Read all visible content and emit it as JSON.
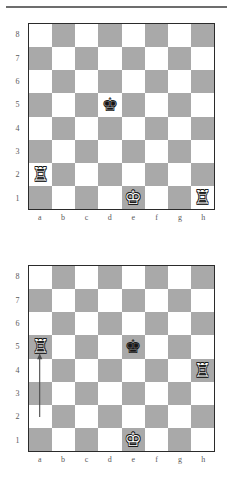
{
  "document": {
    "type": "chess-diagram-pair",
    "top_rule": true
  },
  "labels": {
    "ranks": [
      "8",
      "7",
      "6",
      "5",
      "4",
      "3",
      "2",
      "1"
    ],
    "files": [
      "a",
      "b",
      "c",
      "d",
      "e",
      "f",
      "g",
      "h"
    ]
  },
  "glyphs": {
    "white_king": "♔",
    "white_rook": "♖",
    "black_king": "♚"
  },
  "colors": {
    "light_square": "#ffffff",
    "dark_square": "#a9a9a9",
    "border": "#2b2b2b",
    "label": "#5a5a5a",
    "arrow": "#4a4a4a",
    "rule": "#6d6d6d"
  },
  "diagrams": [
    {
      "id": "diagram-1",
      "name": "position-before-move",
      "pieces": [
        {
          "square": "d5",
          "file": 3,
          "rank": 5,
          "piece": "black_king",
          "color": "black",
          "name": "black-king-d5"
        },
        {
          "square": "a2",
          "file": 0,
          "rank": 2,
          "piece": "white_rook",
          "color": "white",
          "name": "white-rook-a2"
        },
        {
          "square": "e1",
          "file": 4,
          "rank": 1,
          "piece": "white_king",
          "color": "white",
          "name": "white-king-e1"
        },
        {
          "square": "h1",
          "file": 7,
          "rank": 1,
          "piece": "white_rook",
          "color": "white",
          "name": "white-rook-h1"
        }
      ],
      "arrow": null
    },
    {
      "id": "diagram-2",
      "name": "position-after-move",
      "pieces": [
        {
          "square": "a5",
          "file": 0,
          "rank": 5,
          "piece": "white_rook",
          "color": "white",
          "name": "white-rook-a5"
        },
        {
          "square": "e5",
          "file": 4,
          "rank": 5,
          "piece": "black_king",
          "color": "black",
          "name": "black-king-e5"
        },
        {
          "square": "h4",
          "file": 7,
          "rank": 4,
          "piece": "white_rook",
          "color": "white",
          "name": "white-rook-h4"
        },
        {
          "square": "e1",
          "file": 4,
          "rank": 1,
          "piece": "white_king",
          "color": "white",
          "name": "white-king-e1"
        }
      ],
      "arrow": {
        "from": "a2",
        "to": "a5",
        "from_file": 0,
        "from_rank": 2,
        "to_file": 0,
        "to_rank": 5,
        "name": "move-arrow-a2-a5"
      }
    }
  ]
}
